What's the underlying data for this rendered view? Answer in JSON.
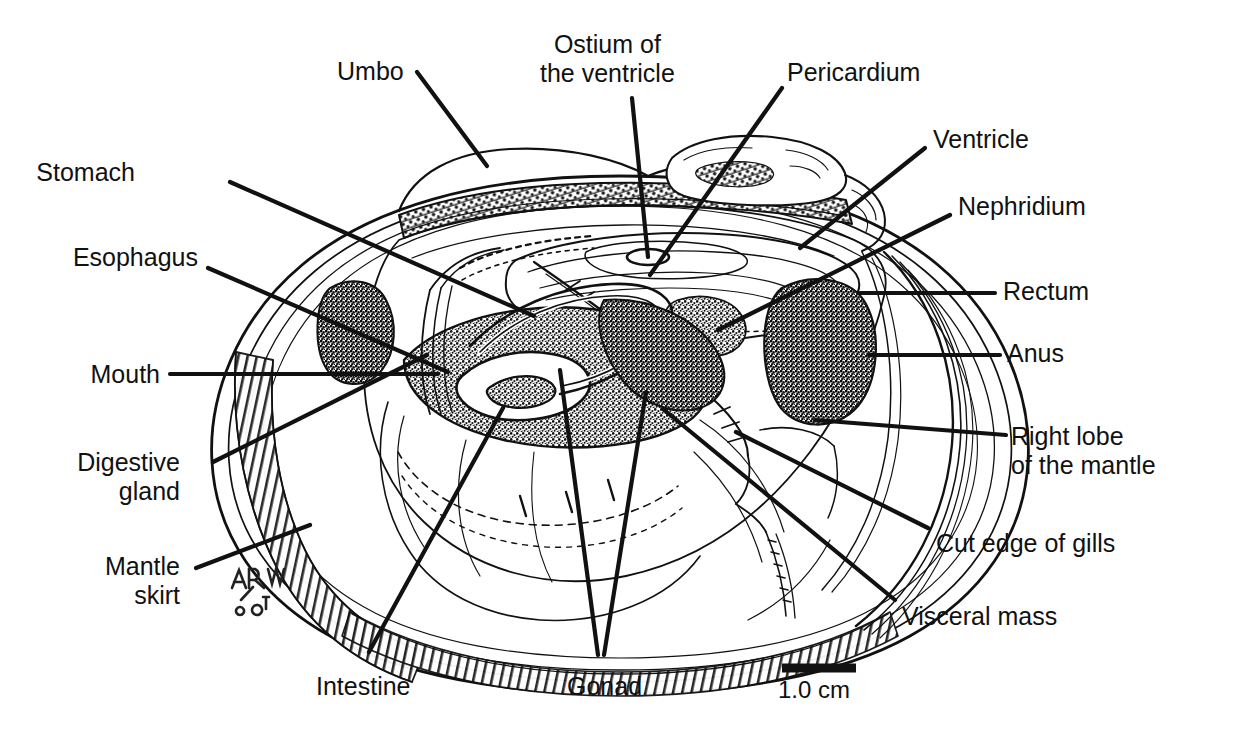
{
  "figure": {
    "background_color": "#ffffff",
    "ink_color": "#111111"
  },
  "labels": {
    "left": [
      {
        "id": "stomach",
        "text": "Stomach",
        "x": 135,
        "y": 168
      },
      {
        "id": "esophagus",
        "text": "Esophagus",
        "x": 72,
        "y": 253
      },
      {
        "id": "mouth",
        "text": "Mouth",
        "x": 75,
        "y": 360
      },
      {
        "id": "digestive-gland",
        "text": "Digestive\ngland",
        "x": 62,
        "y": 450
      },
      {
        "id": "mantle-skirt",
        "text": "Mantle\nskirt",
        "x": 88,
        "y": 555
      }
    ],
    "top": [
      {
        "id": "umbo",
        "text": "Umbo",
        "x": 337,
        "y": 57
      },
      {
        "id": "ostium-of-ventricle",
        "text": "Ostium of\nthe ventricle",
        "x": 540,
        "y": 32
      },
      {
        "id": "pericardium",
        "text": "Pericardium",
        "x": 787,
        "y": 60
      }
    ],
    "right": [
      {
        "id": "ventricle",
        "text": "Ventricle",
        "x": 933,
        "y": 128
      },
      {
        "id": "nephridium",
        "text": "Nephridium",
        "x": 958,
        "y": 194
      },
      {
        "id": "rectum",
        "text": "Rectum",
        "x": 1003,
        "y": 279
      },
      {
        "id": "anus",
        "text": "Anus",
        "x": 1007,
        "y": 341
      },
      {
        "id": "right-lobe-of-mantle",
        "text": "Right lobe\nof the mantle",
        "x": 1015,
        "y": 427
      },
      {
        "id": "cut-edge-of-gills",
        "text": "Cut edge of gills",
        "x": 936,
        "y": 532
      },
      {
        "id": "visceral-mass",
        "text": "Visceral mass",
        "x": 902,
        "y": 608
      }
    ],
    "bottom": [
      {
        "id": "intestine",
        "text": "Intestine",
        "x": 316,
        "y": 680
      },
      {
        "id": "gonad",
        "text": "Gonad",
        "x": 567,
        "y": 680
      }
    ]
  },
  "scale_bar": {
    "caption": "1.0 cm",
    "bar_x1": 782,
    "bar_x2": 856,
    "bar_y": 668,
    "caption_x": 778,
    "caption_y": 678
  },
  "signature": {
    "initials": "ARW",
    "date": "2/08",
    "x": 232,
    "y": 568
  }
}
